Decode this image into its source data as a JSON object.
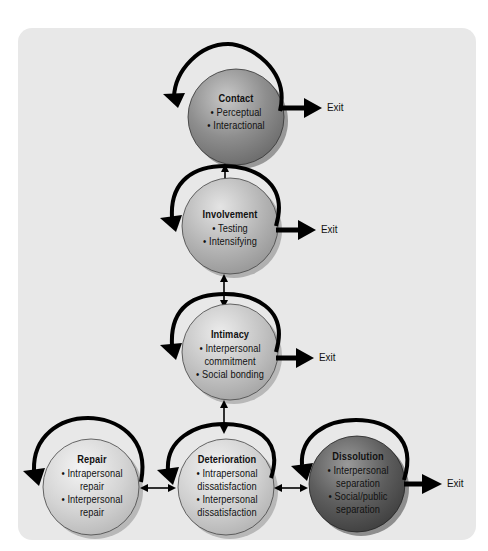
{
  "diagram": {
    "exit_label": "Exit",
    "stages": [
      {
        "id": "contact",
        "title": "Contact",
        "items": [
          "• Perceptual",
          "• Interactional"
        ],
        "color": "#8c8c8c",
        "has_exit": true
      },
      {
        "id": "involvement",
        "title": "Involvement",
        "items": [
          "• Testing",
          "• Intensifying"
        ],
        "color": "#b0b0b0",
        "has_exit": true
      },
      {
        "id": "intimacy",
        "title": "Intimacy",
        "items": [
          "• Interpersonal",
          "commitment",
          "• Social bonding"
        ],
        "color": "#c4c4c4",
        "has_exit": true
      },
      {
        "id": "repair",
        "title": "Repair",
        "items": [
          "• Intrapersonal",
          "repair",
          "• Interpersonal",
          "repair"
        ],
        "color": "#d4d4d4",
        "has_exit": false
      },
      {
        "id": "deterioration",
        "title": "Deterioration",
        "items": [
          "• Intrapersonal",
          "dissatisfaction",
          "• Interpersonal",
          "dissatisfaction"
        ],
        "color": "#d0d0d0",
        "has_exit": false
      },
      {
        "id": "dissolution",
        "title": "Dissolution",
        "items": [
          "• Interpersonal",
          "separation",
          "• Social/public",
          "separation"
        ],
        "color": "#5e5e5e",
        "has_exit": true
      }
    ],
    "connections": [
      {
        "from": "contact",
        "to": "involvement",
        "type": "bidirectional"
      },
      {
        "from": "involvement",
        "to": "intimacy",
        "type": "bidirectional"
      },
      {
        "from": "intimacy",
        "to": "deterioration",
        "type": "bidirectional"
      },
      {
        "from": "repair",
        "to": "deterioration",
        "type": "bidirectional"
      },
      {
        "from": "deterioration",
        "to": "dissolution",
        "type": "bidirectional"
      }
    ],
    "colors": {
      "panel_background": "#e8e8e8",
      "arrow": "#000000"
    }
  }
}
